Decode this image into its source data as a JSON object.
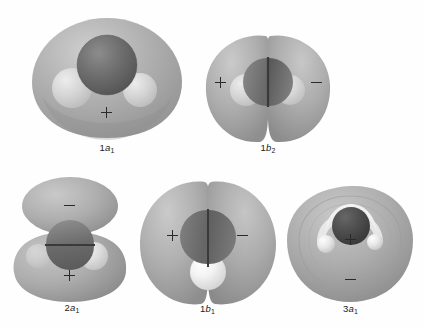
{
  "figure": {
    "background_color": "#fefefe",
    "ink_color": "#2a2a2a",
    "lobe_color": "#a8a8a8",
    "lobe_color_light": "#c4c4c4",
    "oxygen_color": "#6e6e6e",
    "oxygen_color_dark": "#4a4a4a",
    "hydrogen_color": "#d8d8d8",
    "hydrogen_color_bright": "#f4f4f4"
  },
  "orbitals": [
    {
      "id": "1a1",
      "caption_number": "1",
      "caption_letter": "a",
      "caption_subscript": "1",
      "caption_text": "1a1",
      "signs": [
        {
          "symbol": "+",
          "name": "plus-sign-lower-center"
        }
      ]
    },
    {
      "id": "1b2",
      "caption_number": "1",
      "caption_letter": "b",
      "caption_subscript": "2",
      "caption_text": "1b2",
      "signs": [
        {
          "symbol": "+",
          "name": "plus-sign-left-lobe"
        },
        {
          "symbol": "-",
          "name": "minus-sign-right-lobe"
        }
      ]
    },
    {
      "id": "2a1",
      "caption_number": "2",
      "caption_letter": "a",
      "caption_subscript": "1",
      "caption_text": "2a1",
      "signs": [
        {
          "symbol": "-",
          "name": "minus-sign-upper-lobe"
        },
        {
          "symbol": "+",
          "name": "plus-sign-lower-lobe"
        }
      ]
    },
    {
      "id": "1b1",
      "caption_number": "1",
      "caption_letter": "b",
      "caption_subscript": "1",
      "caption_text": "1b1",
      "signs": [
        {
          "symbol": "+",
          "name": "plus-sign-left-lobe"
        },
        {
          "symbol": "-",
          "name": "minus-sign-right-lobe"
        }
      ]
    },
    {
      "id": "3a1",
      "caption_number": "3",
      "caption_letter": "a",
      "caption_subscript": "1",
      "caption_text": "3a1",
      "signs": [
        {
          "symbol": "+",
          "name": "plus-sign-inner-core"
        },
        {
          "symbol": "-",
          "name": "minus-sign-lower-lobe"
        }
      ]
    }
  ]
}
